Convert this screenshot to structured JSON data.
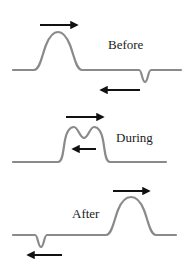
{
  "diagram": {
    "colors": {
      "wave": "#8a8a8a",
      "arrow": "#111111",
      "text": "#222222",
      "background": "#ffffff"
    },
    "panels": [
      {
        "label": "Before",
        "pulses": [
          {
            "shape": "upward-hump",
            "direction": "right"
          },
          {
            "shape": "inverted-dip",
            "direction": "left"
          }
        ]
      },
      {
        "label": "During",
        "pulses": [
          {
            "shape": "double-hump-superposition",
            "direction": "right"
          },
          {
            "shape": "overlap",
            "direction": "left"
          }
        ]
      },
      {
        "label": "After",
        "pulses": [
          {
            "shape": "upward-hump",
            "direction": "right"
          },
          {
            "shape": "inverted-dip",
            "direction": "left"
          }
        ]
      }
    ]
  }
}
